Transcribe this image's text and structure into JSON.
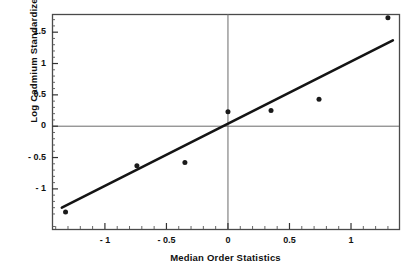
{
  "figure": {
    "clipped_top_text": "Normal Probability Plot",
    "background_color": "#ffffff",
    "frame_color": "#4a4a4a",
    "marker_color": "#1a1a1a",
    "line_color": "#141414",
    "reference_line_color": "#6b6b6b"
  },
  "chart_data": {
    "type": "scatter",
    "title": "",
    "xlabel": "Median Order Statistics",
    "ylabel": "Log Cadmium Standardized",
    "xlim": [
      -1.43,
      1.39
    ],
    "ylim": [
      -1.64,
      1.79
    ],
    "xticks": [
      -1,
      -0.5,
      0,
      0.5,
      1
    ],
    "xticklabels": [
      "- 1",
      "- 0.5",
      "0",
      "0.5",
      "1"
    ],
    "yticks": [
      -1,
      -0.5,
      0,
      0.5,
      1,
      1.5
    ],
    "yticklabels": [
      "- 1",
      "- 0.5",
      "0",
      "0.5",
      "1",
      "1.5"
    ],
    "grid": false,
    "legend": null,
    "series": [
      {
        "name": "Standardized residuals",
        "type": "scatter",
        "marker": "filled-circle",
        "x": [
          -1.32,
          -0.74,
          -0.35,
          0.0,
          0.35,
          0.74,
          1.3
        ],
        "y": [
          -1.37,
          -0.63,
          -0.58,
          0.23,
          0.25,
          0.43,
          1.73
        ]
      },
      {
        "name": "Fitted reference line",
        "type": "line",
        "x": [
          -1.35,
          1.34
        ],
        "y": [
          -1.3,
          1.37
        ]
      }
    ],
    "reference_lines": [
      {
        "orientation": "horizontal",
        "value": 0
      },
      {
        "orientation": "vertical",
        "value": 0
      }
    ]
  }
}
